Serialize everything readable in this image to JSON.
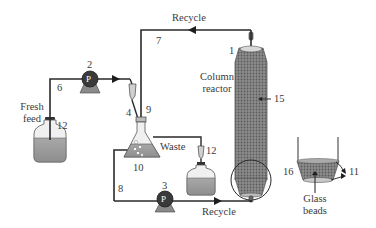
{
  "diagram": {
    "type": "process-flow",
    "labels": {
      "recycle_top": "Recycle",
      "recycle_bottom": "Recycle",
      "column_reactor_line1": "Column",
      "column_reactor_line2": "reactor",
      "fresh_feed_line1": "Fresh",
      "fresh_feed_line2": "feed",
      "waste": "Waste",
      "glass_beads_line1": "Glass",
      "glass_beads_line2": "beads",
      "pump_symbol": "P"
    },
    "numbers": {
      "n1": "1",
      "n2": "2",
      "n3": "3",
      "n4": "4",
      "n6": "6",
      "n7": "7",
      "n8": "8",
      "n9": "9",
      "n10": "10",
      "n11": "11",
      "n12a": "12",
      "n12b": "12",
      "n15": "15",
      "n16": "16"
    },
    "components": [
      {
        "id": "1",
        "name": "column outlet"
      },
      {
        "id": "2",
        "name": "feed pump"
      },
      {
        "id": "3",
        "name": "recycle pump"
      },
      {
        "id": "4",
        "name": "feed line to flask"
      },
      {
        "id": "6",
        "name": "fresh feed line"
      },
      {
        "id": "7",
        "name": "recycle line"
      },
      {
        "id": "8",
        "name": "flask outlet line"
      },
      {
        "id": "9",
        "name": "flask inlet"
      },
      {
        "id": "10",
        "name": "mixing flask"
      },
      {
        "id": "11",
        "name": "outlets"
      },
      {
        "id": "12",
        "name": "stopper / drip"
      },
      {
        "id": "15",
        "name": "packed bed"
      },
      {
        "id": "16",
        "name": "glass bead support"
      }
    ],
    "colors": {
      "line": "#2a2a2a",
      "pump_body": "#3a3a3a",
      "pump_base": "#8a8a8a",
      "liquid": "#9a9a9a",
      "vessel_outline": "#555555",
      "column_fill": "#7a7a7a"
    }
  }
}
